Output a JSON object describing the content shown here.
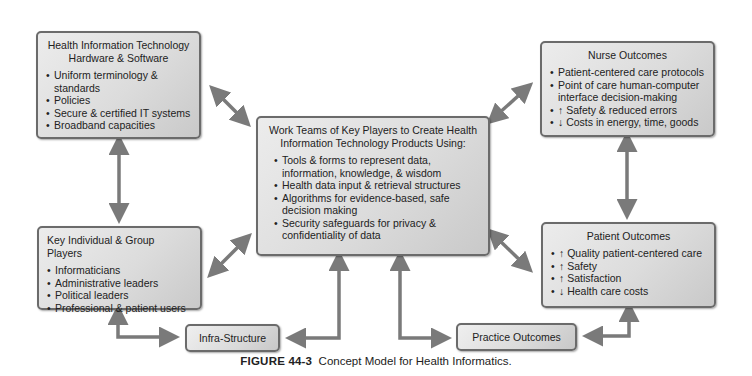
{
  "diagram": {
    "hit_box": {
      "title_line1": "Health Information Technology",
      "title_line2": "Hardware & Software",
      "items": [
        "Uniform terminology & standards",
        "Policies",
        "Secure & certified IT systems",
        "Broadband capacities"
      ]
    },
    "players_box": {
      "title": "Key Individual & Group Players",
      "items": [
        "Informaticians",
        "Administrative leaders",
        "Political leaders",
        "Professional & patient users"
      ]
    },
    "work_teams_box": {
      "title_line1": "Work Teams of Key Players to Create Health",
      "title_line2": "Information Technology Products Using:",
      "items": [
        "Tools & forms to represent data, information, knowledge, & wisdom",
        "Health data input & retrieval structures",
        "Algorithms for evidence-based, safe decision making",
        "Security safeguards for privacy & confidentiality of data"
      ]
    },
    "nurse_box": {
      "title": "Nurse Outcomes",
      "items": [
        "Patient-centered care protocols",
        "Point of care human-computer interface decision-making",
        "↑ Safety & reduced errors",
        "↓ Costs in energy, time, goods"
      ]
    },
    "patient_box": {
      "title": "Patient Outcomes",
      "items": [
        "↑ Quality patient-centered care",
        "↑ Safety",
        "↑ Satisfaction",
        "↓ Health care costs"
      ]
    },
    "infra_label": "Infra-Structure",
    "practice_label": "Practice Outcomes",
    "caption_figure": "FIGURE 44-3",
    "caption_text": "Concept Model for Health Informatics.",
    "colors": {
      "arrow": "#7a7a7a",
      "border": "#6b6b6b",
      "box_fill": "#dcdcdc"
    }
  }
}
